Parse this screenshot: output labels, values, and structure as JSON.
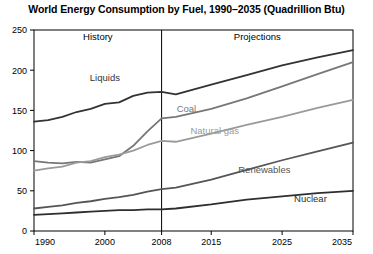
{
  "chart_data": {
    "type": "line",
    "title": "World Energy Consumption by Fuel, 1990–2035 (Quadrillion Btu)",
    "xlabel": "",
    "ylabel": "",
    "xlim": [
      1990,
      2035
    ],
    "ylim": [
      0,
      250
    ],
    "grid": false,
    "legend_position": "inline-labels",
    "x_ticks": [
      "1990",
      "2000",
      "2008",
      "2015",
      "2025",
      "2035"
    ],
    "x_tick_values": [
      1990,
      2000,
      2008,
      2015,
      2025,
      2035
    ],
    "y_ticks": [
      "0",
      "50",
      "100",
      "150",
      "200",
      "250"
    ],
    "y_tick_values": [
      0,
      50,
      100,
      150,
      200,
      250
    ],
    "annotations": [
      {
        "text": "History",
        "x": 1999,
        "y": 238,
        "kind": "period-label"
      },
      {
        "text": "Projections",
        "x": 2021.5,
        "y": 238,
        "kind": "period-label"
      },
      {
        "text": "2008 divider",
        "x": 2008,
        "kind": "vertical-rule"
      }
    ],
    "x": [
      1990,
      1992,
      1994,
      1996,
      1998,
      2000,
      2002,
      2004,
      2006,
      2008,
      2010,
      2015,
      2020,
      2025,
      2030,
      2035
    ],
    "series": [
      {
        "name": "Liquids",
        "color": "#333333",
        "label_x": 2000,
        "label_y": 186,
        "values": [
          136,
          138,
          142,
          148,
          152,
          158,
          160,
          168,
          172,
          173,
          170,
          182,
          194,
          206,
          216,
          225
        ]
      },
      {
        "name": "Coal",
        "color": "#777777",
        "label_x": 2011.5,
        "label_y": 148,
        "values": [
          87,
          85,
          84,
          86,
          85,
          89,
          93,
          106,
          124,
          140,
          142,
          152,
          165,
          180,
          195,
          210
        ]
      },
      {
        "name": "Natural gas",
        "color": "#9a9a9a",
        "label_x": 2015.5,
        "label_y": 121,
        "values": [
          75,
          78,
          80,
          85,
          87,
          92,
          95,
          100,
          107,
          112,
          111,
          121,
          132,
          142,
          153,
          163
        ]
      },
      {
        "name": "Renewables",
        "color": "#555555",
        "label_x": 2022.5,
        "label_y": 72,
        "values": [
          28,
          30,
          32,
          35,
          37,
          40,
          42,
          45,
          49,
          52,
          54,
          64,
          76,
          88,
          99,
          110
        ]
      },
      {
        "name": "Nuclear",
        "color": "#2e2e2e",
        "label_x": 2029,
        "label_y": 36,
        "values": [
          20,
          21,
          22,
          23,
          24,
          25,
          26,
          26,
          27,
          27,
          28,
          33,
          39,
          43,
          47,
          50
        ]
      }
    ]
  }
}
